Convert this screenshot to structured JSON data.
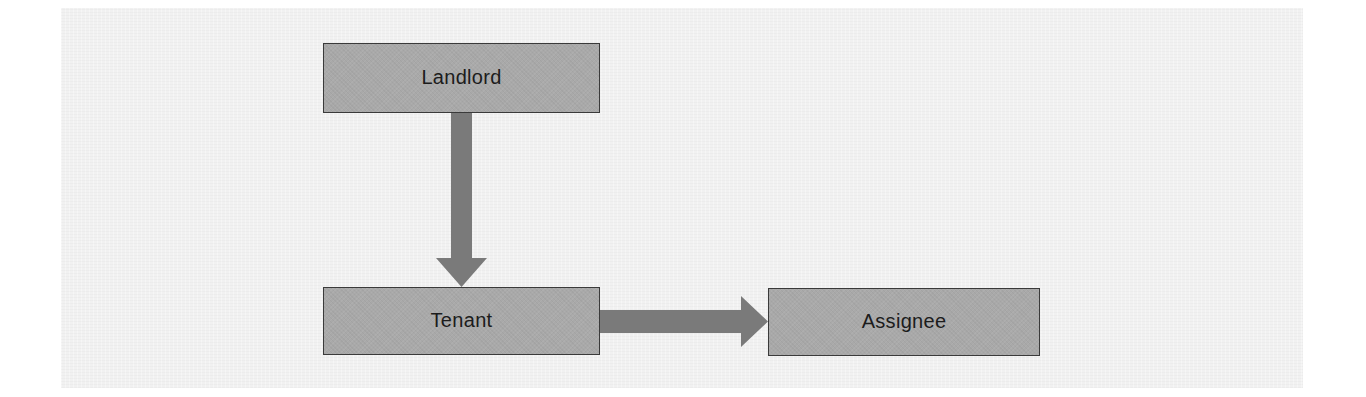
{
  "diagram": {
    "type": "flow",
    "nodes": [
      {
        "id": "landlord",
        "label": "Landlord"
      },
      {
        "id": "tenant",
        "label": "Tenant"
      },
      {
        "id": "assignee",
        "label": "Assignee"
      }
    ],
    "edges": [
      {
        "from": "landlord",
        "to": "tenant",
        "direction": "down"
      },
      {
        "from": "tenant",
        "to": "assignee",
        "direction": "right"
      }
    ],
    "colors": {
      "node_fill": "#a9a9a9",
      "node_border": "#3a3a3a",
      "arrow": "#7a7a7a",
      "text": "#1c1c1c",
      "background": "#f1f1f1"
    }
  }
}
